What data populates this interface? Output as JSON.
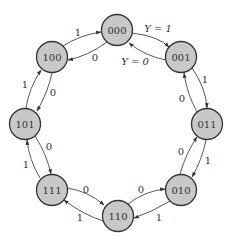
{
  "diagram": {
    "type": "state-transition-diagram",
    "node_fill": "#c8c8c8",
    "node_stroke": "#333333",
    "nodes": [
      {
        "id": "000",
        "label": "000",
        "x": 117,
        "y": 30
      },
      {
        "id": "001",
        "label": "001",
        "x": 181,
        "y": 57
      },
      {
        "id": "011",
        "label": "011",
        "x": 207,
        "y": 124
      },
      {
        "id": "010",
        "label": "010",
        "x": 181,
        "y": 190
      },
      {
        "id": "110",
        "label": "110",
        "x": 118,
        "y": 216
      },
      {
        "id": "111",
        "label": "111",
        "x": 52,
        "y": 190
      },
      {
        "id": "101",
        "label": "101",
        "x": 25,
        "y": 124
      },
      {
        "id": "100",
        "label": "100",
        "x": 52,
        "y": 57
      }
    ],
    "edges": [
      {
        "from": "000",
        "to": "001",
        "label": "Y = 1"
      },
      {
        "from": "001",
        "to": "000",
        "label": "Y = 0"
      },
      {
        "from": "001",
        "to": "011",
        "label": "1"
      },
      {
        "from": "011",
        "to": "001",
        "label": "0"
      },
      {
        "from": "011",
        "to": "010",
        "label": "1"
      },
      {
        "from": "010",
        "to": "011",
        "label": "0"
      },
      {
        "from": "010",
        "to": "110",
        "label": "1"
      },
      {
        "from": "110",
        "to": "010",
        "label": "0"
      },
      {
        "from": "110",
        "to": "111",
        "label": "1"
      },
      {
        "from": "111",
        "to": "110",
        "label": "0"
      },
      {
        "from": "111",
        "to": "101",
        "label": "1"
      },
      {
        "from": "101",
        "to": "111",
        "label": "0"
      },
      {
        "from": "101",
        "to": "100",
        "label": "1"
      },
      {
        "from": "100",
        "to": "101",
        "label": "0"
      },
      {
        "from": "100",
        "to": "000",
        "label": "1"
      },
      {
        "from": "000",
        "to": "100",
        "label": "0"
      }
    ]
  }
}
